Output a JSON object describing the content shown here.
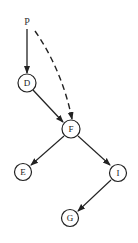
{
  "diagram": {
    "type": "tree",
    "root_label": "P",
    "nodes": [
      {
        "id": "D",
        "label": "D",
        "x": 27,
        "y": 83
      },
      {
        "id": "F",
        "label": "F",
        "x": 71,
        "y": 129
      },
      {
        "id": "E",
        "label": "E",
        "x": 23,
        "y": 172
      },
      {
        "id": "I",
        "label": "I",
        "x": 118,
        "y": 173
      },
      {
        "id": "G",
        "label": "G",
        "x": 70,
        "y": 218
      }
    ],
    "edges": [
      {
        "from": "P",
        "to": "D",
        "style": "solid"
      },
      {
        "from": "P",
        "to": "F",
        "style": "dashed"
      },
      {
        "from": "D",
        "to": "F",
        "style": "solid"
      },
      {
        "from": "F",
        "to": "E",
        "style": "solid"
      },
      {
        "from": "F",
        "to": "I",
        "style": "solid"
      },
      {
        "from": "I",
        "to": "G",
        "style": "solid"
      }
    ]
  }
}
